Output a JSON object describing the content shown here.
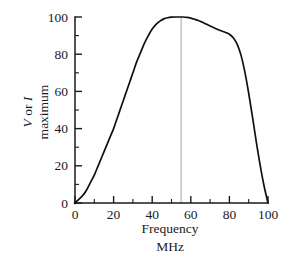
{
  "chart_data": {
    "type": "line",
    "title": "",
    "subtitle": "",
    "xlabel": "Frequency",
    "xlabel_units": "MHz",
    "ylabel_line1": "V or I",
    "ylabel_line2": "maximum",
    "ylabel_italic_parts": [
      "V",
      "I"
    ],
    "xlim": [
      0,
      100
    ],
    "ylim": [
      0,
      100
    ],
    "x_major_ticks": [
      0,
      20,
      40,
      60,
      80,
      100
    ],
    "x_minor_ticks": [
      10,
      30,
      50,
      70,
      90
    ],
    "y_major_ticks": [
      0,
      20,
      40,
      60,
      80,
      100
    ],
    "y_minor_ticks": [
      10,
      30,
      50,
      70,
      90
    ],
    "x_tick_labels": [
      "0",
      "20",
      "40",
      "60",
      "80",
      "100"
    ],
    "y_tick_labels": [
      "0",
      "20",
      "40",
      "60",
      "80",
      "100"
    ],
    "grid": false,
    "legend": false,
    "legend_position": "none",
    "curve_color": "#101010",
    "marker_line_color": "#b4b4b4",
    "annotations": [
      {
        "name": "resonance-marker",
        "type": "vertical-line",
        "x": 55,
        "y_from": 0,
        "y_to": 100,
        "color": "#b4b4b4"
      }
    ],
    "series": [
      {
        "name": "response",
        "x": [
          0,
          2,
          4,
          6,
          8,
          10,
          12,
          14,
          16,
          18,
          20,
          22,
          24,
          26,
          28,
          30,
          32,
          34,
          36,
          38,
          40,
          42,
          44,
          46,
          48,
          50,
          52,
          54,
          55,
          56,
          58,
          60,
          62,
          64,
          66,
          68,
          70,
          72,
          74,
          76,
          78,
          80,
          82,
          84,
          86,
          88,
          90,
          92,
          94,
          96,
          98,
          100
        ],
        "values": [
          0,
          2,
          4,
          7,
          11,
          15,
          20,
          25,
          30,
          35,
          40,
          46,
          52,
          58,
          64,
          70,
          76,
          81,
          86,
          90,
          93.5,
          96,
          97.8,
          99,
          99.6,
          99.9,
          100,
          100,
          100,
          100,
          99.8,
          99.4,
          98.8,
          98.1,
          97.2,
          96.2,
          95.2,
          94.2,
          93.3,
          92.5,
          91.7,
          90.7,
          88.8,
          85.4,
          79.5,
          70.5,
          59,
          46,
          32.5,
          20,
          9,
          0
        ]
      }
    ]
  }
}
